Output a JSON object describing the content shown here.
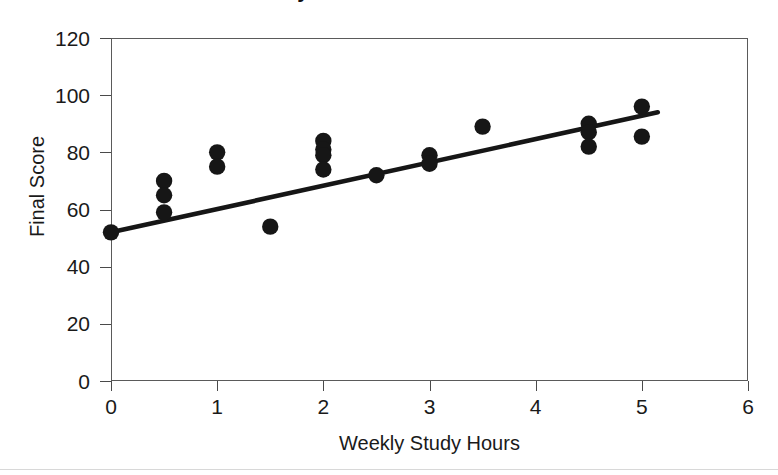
{
  "figure": {
    "title": "Study Hours vs Final Score",
    "title_visible": "partially cropped at top edge",
    "background_color": "#ffffff",
    "marker_color": "#161616",
    "line_color": "#161616",
    "frame_color": "#5a5a5a"
  },
  "axes": {
    "x": {
      "label": "Weekly Study Hours",
      "ticks": [
        "0",
        "1",
        "2",
        "3",
        "4",
        "5",
        "6"
      ],
      "min": 0,
      "max": 6
    },
    "y": {
      "label": "Final Score",
      "ticks": [
        "0",
        "20",
        "40",
        "60",
        "80",
        "100",
        "120"
      ],
      "min": 0,
      "max": 120
    }
  },
  "chart_data": {
    "type": "scatter",
    "title": "Study Hours vs Final Score",
    "xlabel": "Weekly Study Hours",
    "ylabel": "Final Score",
    "xlim": [
      0,
      6
    ],
    "ylim": [
      0,
      120
    ],
    "xticks": [
      0,
      1,
      2,
      3,
      4,
      5,
      6
    ],
    "yticks": [
      0,
      20,
      40,
      60,
      80,
      100,
      120
    ],
    "grid": false,
    "legend": false,
    "series": [
      {
        "name": "Students",
        "marker": "filled-circle",
        "color": "#161616",
        "points": [
          {
            "x": 0.0,
            "y": 52
          },
          {
            "x": 0.5,
            "y": 70
          },
          {
            "x": 0.5,
            "y": 65
          },
          {
            "x": 0.5,
            "y": 59
          },
          {
            "x": 1.0,
            "y": 80
          },
          {
            "x": 1.0,
            "y": 75
          },
          {
            "x": 1.5,
            "y": 54
          },
          {
            "x": 2.0,
            "y": 84
          },
          {
            "x": 2.0,
            "y": 81
          },
          {
            "x": 2.0,
            "y": 79
          },
          {
            "x": 2.0,
            "y": 74
          },
          {
            "x": 2.5,
            "y": 72
          },
          {
            "x": 3.0,
            "y": 79
          },
          {
            "x": 3.0,
            "y": 76
          },
          {
            "x": 3.5,
            "y": 89
          },
          {
            "x": 4.5,
            "y": 90
          },
          {
            "x": 4.5,
            "y": 87
          },
          {
            "x": 4.5,
            "y": 82
          },
          {
            "x": 5.0,
            "y": 96
          },
          {
            "x": 5.0,
            "y": 85.5
          }
        ]
      }
    ],
    "trendline": {
      "name": "Linear fit",
      "color": "#161616",
      "x_start": 0.0,
      "y_start": 52,
      "x_end": 5.15,
      "y_end": 94
    }
  }
}
